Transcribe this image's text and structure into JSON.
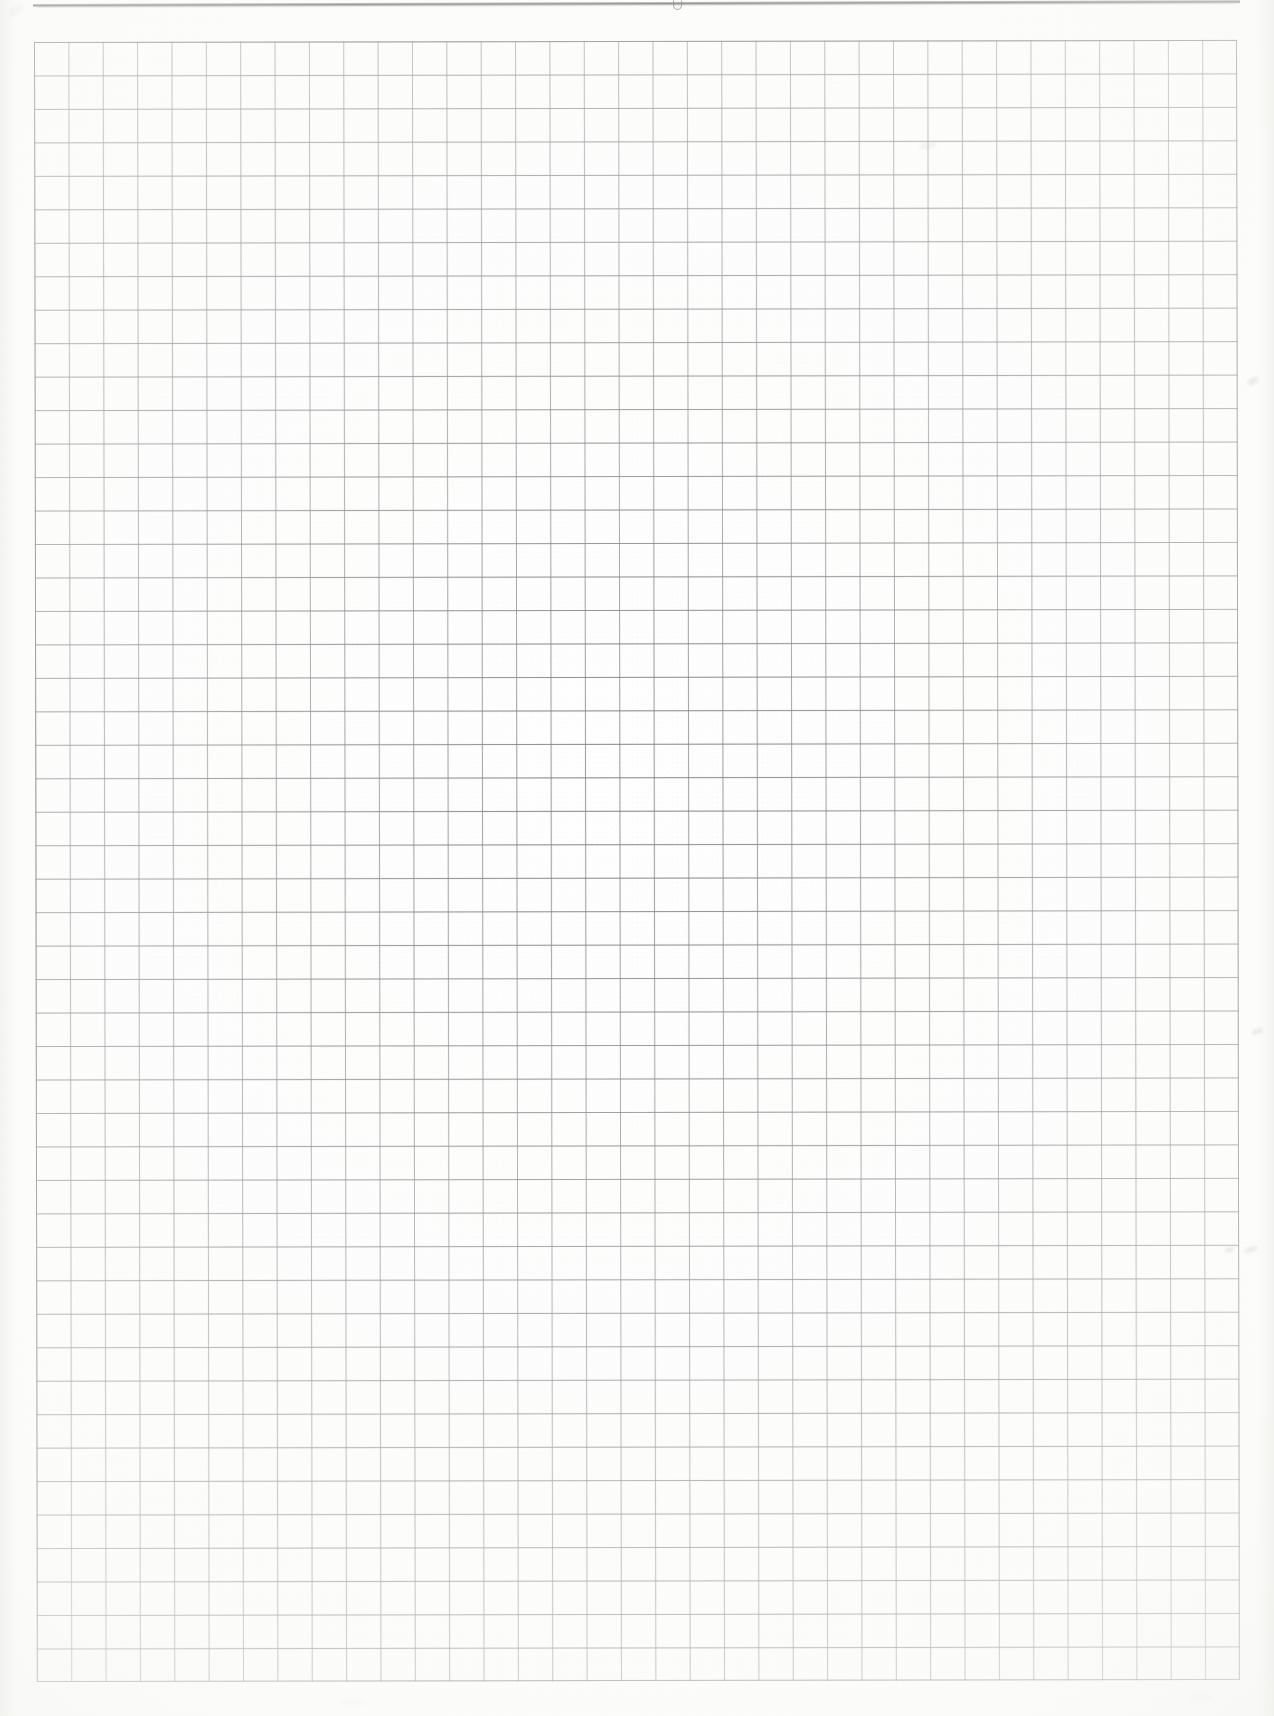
{
  "document": {
    "kind": "scanned-graph-paper-sheet",
    "title": "",
    "body_text": "",
    "page_width": 1274,
    "page_height": 1716,
    "background_color": "#fefefe"
  },
  "top_rule": {
    "description": "heavy dark horizontal ruled line near the top edge of the sheet",
    "color": "#484850",
    "left": 33,
    "top": 4,
    "width": 1207,
    "thickness": 3,
    "mark_label": ""
  },
  "grid": {
    "description": "printed square graph-paper grid",
    "line_color": "#6e6e76",
    "border_color": "#5f5f64",
    "left": 34,
    "top": 42,
    "width": 1203,
    "height": 1640,
    "columns": 35,
    "rows": 49,
    "cell_width": 34.37,
    "cell_height": 33.47
  },
  "annotations": {
    "handwriting": "",
    "margin_notes": "",
    "smudge_count": 8
  }
}
